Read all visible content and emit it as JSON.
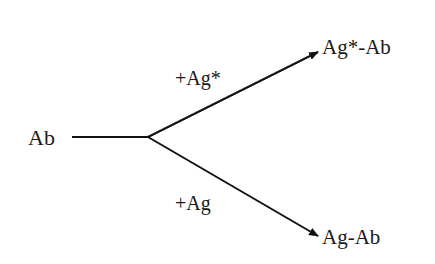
{
  "diagram": {
    "source": {
      "label": "Ab"
    },
    "branches": [
      {
        "reagent": "+Ag*",
        "product": "Ag*-Ab"
      },
      {
        "reagent": "+Ag",
        "product": "Ag-Ab"
      }
    ],
    "colors": {
      "stroke": "#111111",
      "text": "#1a1a1a",
      "background": "#ffffff"
    }
  }
}
